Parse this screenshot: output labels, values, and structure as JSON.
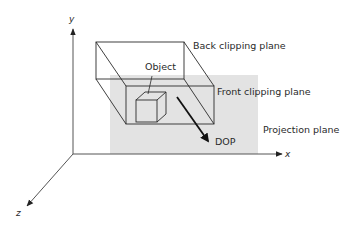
{
  "diagram": {
    "axes": {
      "x_label": "x",
      "y_label": "y",
      "z_label": "z"
    },
    "labels": {
      "back_clipping_plane": "Back clipping plane",
      "front_clipping_plane": "Front clipping plane",
      "projection_plane": "Projection plane",
      "object": "Object",
      "dop": "DOP"
    },
    "colors": {
      "projection_plane_fill": "#e3e3e3",
      "line": "#2a2a2a",
      "axis": "#555555",
      "dop_arrow": "#111111"
    }
  }
}
